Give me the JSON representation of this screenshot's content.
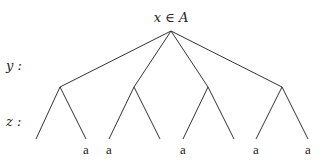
{
  "diagram": {
    "type": "tree",
    "root": {
      "label": "x ∈ A",
      "x": 171,
      "y": 31
    },
    "level_labels": [
      {
        "label": "y :",
        "x": 6,
        "y": 66
      },
      {
        "label": "z :",
        "x": 6,
        "y": 122
      }
    ],
    "y_nodes": [
      {
        "x": 60,
        "y": 87
      },
      {
        "x": 134,
        "y": 87
      },
      {
        "x": 208,
        "y": 87
      },
      {
        "x": 282,
        "y": 87
      }
    ],
    "leaves": [
      {
        "x": 36,
        "y": 139,
        "label": ""
      },
      {
        "x": 86,
        "y": 139,
        "label": "a"
      },
      {
        "x": 109,
        "y": 139,
        "label": "a"
      },
      {
        "x": 160,
        "y": 139,
        "label": ""
      },
      {
        "x": 183,
        "y": 139,
        "label": "a"
      },
      {
        "x": 234,
        "y": 139,
        "label": ""
      },
      {
        "x": 256,
        "y": 139,
        "label": "a"
      },
      {
        "x": 308,
        "y": 139,
        "label": "a"
      }
    ]
  }
}
